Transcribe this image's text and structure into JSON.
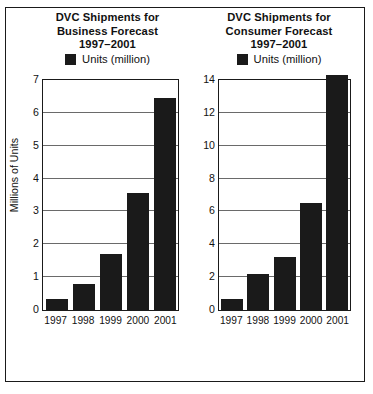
{
  "figure": {
    "border_color": "#1a1a1a",
    "background": "#ffffff"
  },
  "chart_data": [
    {
      "type": "bar",
      "panel": "left",
      "title": "DVC Shipments for Business Forecast 1997–2001",
      "title_lines": [
        "DVC Shipments for",
        "Business Forecast",
        "1997–2001"
      ],
      "legend": {
        "label": "Units (million)",
        "swatch_color": "#1a1a1a",
        "position": "top-center"
      },
      "xlabel": "",
      "ylabel": "Millions of Units",
      "categories": [
        "1997",
        "1998",
        "1999",
        "2000",
        "2001"
      ],
      "values": [
        0.35,
        0.8,
        1.7,
        3.55,
        6.45
      ],
      "series": [
        {
          "name": "Units (million)",
          "values": [
            0.35,
            0.8,
            1.7,
            3.55,
            6.45
          ],
          "color": "#1a1a1a"
        }
      ],
      "ylim": [
        0,
        7
      ],
      "yticks": [
        0,
        1,
        2,
        3,
        4,
        5,
        6,
        7
      ],
      "ytick_labels": [
        "0",
        "1",
        "2",
        "3",
        "4",
        "5",
        "6",
        "7"
      ],
      "grid": true,
      "grid_axis": "y"
    },
    {
      "type": "bar",
      "panel": "right",
      "title": "DVC Shipments for Consumer Forecast 1997–2001",
      "title_lines": [
        "DVC Shipments for",
        "Consumer Forecast",
        "1997–2001"
      ],
      "legend": {
        "label": "Units (million)",
        "swatch_color": "#1a1a1a",
        "position": "top-center"
      },
      "xlabel": "",
      "ylabel": "",
      "categories": [
        "1997",
        "1998",
        "1999",
        "2000",
        "2001"
      ],
      "values": [
        0.7,
        2.2,
        3.2,
        6.5,
        14.3
      ],
      "series": [
        {
          "name": "Units (million)",
          "values": [
            0.7,
            2.2,
            3.2,
            6.5,
            14.3
          ],
          "color": "#1a1a1a"
        }
      ],
      "ylim": [
        0,
        14
      ],
      "yticks": [
        0,
        2,
        4,
        6,
        8,
        10,
        12,
        14
      ],
      "ytick_labels": [
        "0",
        "2",
        "4",
        "6",
        "8",
        "10",
        "12",
        "14"
      ],
      "grid": true,
      "grid_axis": "y"
    }
  ]
}
